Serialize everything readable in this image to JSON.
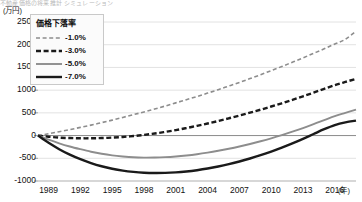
{
  "title_sliver": "不動産価格の将来推計 シミュレーション",
  "axis": {
    "y_unit": "(万円)",
    "x_unit": "(年)",
    "y_ticks": [
      2500,
      2000,
      1500,
      1000,
      500,
      0,
      -500,
      -1000
    ],
    "x_ticks": [
      1989,
      1992,
      1995,
      1998,
      2001,
      2004,
      2007,
      2010,
      2013,
      2016
    ]
  },
  "legend": {
    "title": "価格下落率",
    "items": [
      {
        "label": "-1.0%",
        "style": "fine-dash",
        "color": "#8d8d8d"
      },
      {
        "label": "-3.0%",
        "style": "bold-dash",
        "color": "#1a1a1a"
      },
      {
        "label": "-5.0%",
        "style": "solid",
        "color": "#8d8d8d"
      },
      {
        "label": "-7.0%",
        "style": "bold-solid",
        "color": "#1a1a1a"
      }
    ]
  },
  "colors": {
    "gray_series": "#8d8d8d",
    "black_series": "#1a1a1a",
    "gridline": "#e2e2e2",
    "zero_line": "#8a8a8a",
    "background": "#ffffff"
  },
  "chart_data": {
    "type": "line",
    "title": "不動産価格の将来推計 シミュレーション",
    "xlabel": "(年)",
    "ylabel": "(万円)",
    "xlim": [
      1988,
      2018
    ],
    "ylim": [
      -1000,
      2500
    ],
    "grid": true,
    "legend_position": "top-left",
    "x": [
      1988,
      1989,
      1990,
      1991,
      1992,
      1993,
      1994,
      1995,
      1996,
      1997,
      1998,
      1999,
      2000,
      2001,
      2002,
      2003,
      2004,
      2005,
      2006,
      2007,
      2008,
      2009,
      2010,
      2011,
      2012,
      2013,
      2014,
      2015,
      2016,
      2017,
      2018
    ],
    "series": [
      {
        "name": "-1.0%",
        "style": "fine-dash",
        "color": "#8d8d8d",
        "values": [
          0,
          40,
          85,
          130,
          180,
          230,
          285,
          340,
          400,
          460,
          520,
          585,
          650,
          720,
          790,
          860,
          935,
          1010,
          1090,
          1170,
          1255,
          1340,
          1430,
          1520,
          1615,
          1710,
          1810,
          1910,
          2015,
          2120,
          2300
        ]
      },
      {
        "name": "-3.0%",
        "style": "bold-dash",
        "color": "#1a1a1a",
        "values": [
          0,
          -25,
          -45,
          -55,
          -60,
          -60,
          -55,
          -45,
          -30,
          -10,
          15,
          45,
          80,
          120,
          165,
          215,
          265,
          320,
          380,
          440,
          505,
          570,
          640,
          710,
          785,
          865,
          945,
          1030,
          1110,
          1180,
          1250
        ]
      },
      {
        "name": "-5.0%",
        "style": "solid",
        "color": "#8d8d8d",
        "values": [
          0,
          -90,
          -170,
          -240,
          -300,
          -355,
          -400,
          -435,
          -460,
          -478,
          -485,
          -483,
          -475,
          -460,
          -438,
          -410,
          -375,
          -335,
          -290,
          -240,
          -185,
          -125,
          -60,
          10,
          85,
          165,
          250,
          340,
          430,
          500,
          570
        ]
      },
      {
        "name": "-7.0%",
        "style": "bold-solid",
        "color": "#1a1a1a",
        "values": [
          0,
          -160,
          -300,
          -420,
          -520,
          -605,
          -675,
          -730,
          -772,
          -800,
          -818,
          -825,
          -822,
          -810,
          -790,
          -762,
          -726,
          -682,
          -630,
          -570,
          -505,
          -432,
          -352,
          -265,
          -172,
          -72,
          35,
          140,
          230,
          290,
          330
        ]
      }
    ]
  }
}
